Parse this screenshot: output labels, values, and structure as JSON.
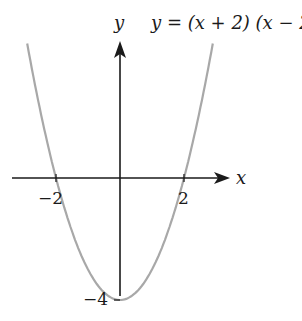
{
  "chart_data": {
    "type": "line",
    "title": "y = (x + 2) (x − 2)",
    "xlabel": "x",
    "ylabel": "y",
    "function": "y = (x + 2)(x - 2)",
    "x_ticks": [
      {
        "value": -2,
        "label": "−2"
      },
      {
        "value": 2,
        "label": "2"
      }
    ],
    "y_ticks": [
      {
        "value": -4,
        "label": "−4"
      }
    ],
    "key_points": [
      {
        "x": -2,
        "y": 0,
        "note": "root"
      },
      {
        "x": 2,
        "y": 0,
        "note": "root"
      },
      {
        "x": 0,
        "y": -4,
        "note": "vertex / y-intercept"
      }
    ],
    "x": [
      -2.9,
      -2.5,
      -2,
      -1.5,
      -1,
      -0.5,
      0,
      0.5,
      1,
      1.5,
      2,
      2.5,
      2.9
    ],
    "values": [
      4.41,
      2.25,
      0,
      -1.75,
      -3,
      -3.75,
      -4,
      -3.75,
      -3,
      -1.75,
      0,
      2.25,
      4.41
    ],
    "xlim": [
      -3.5,
      3.5
    ],
    "ylim": [
      -4.5,
      4.5
    ],
    "grid": false,
    "legend": null,
    "colors": {
      "curve": "#a8a8a8",
      "axes": "#1a1a1a"
    }
  },
  "labels": {
    "equation": "y = (x + 2) (x − 2)",
    "y_axis": "y",
    "x_axis": "x",
    "tick_neg2": "−2",
    "tick_pos2": "2",
    "tick_neg4": "−4"
  }
}
